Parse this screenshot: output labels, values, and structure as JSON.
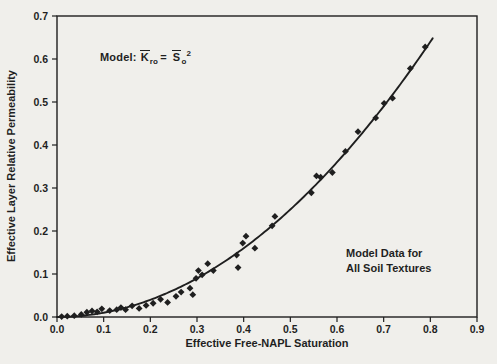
{
  "figure": {
    "background_color": "#f0efeb",
    "ink_color": "#1f1f1f"
  },
  "chart_data": {
    "type": "scatter",
    "title": "",
    "xlabel": "Effective Free-NAPL Saturation",
    "ylabel": "Effective Layer Relative Permeability",
    "xlim": [
      0.0,
      0.9
    ],
    "ylim": [
      0.0,
      0.7
    ],
    "grid": false,
    "legend": "none",
    "marker": "diamond",
    "xticks": [
      0.0,
      0.1,
      0.2,
      0.3,
      0.4,
      0.5,
      0.6,
      0.7,
      0.8,
      0.9
    ],
    "xtick_labels": [
      "0.0",
      "0.1",
      "0.2",
      "0.3",
      "0.4",
      "0.5",
      "0.6",
      "0.7",
      "0.8",
      "0.9"
    ],
    "yticks": [
      0.0,
      0.1,
      0.2,
      0.3,
      0.4,
      0.5,
      0.6,
      0.7
    ],
    "ytick_labels": [
      "0.0",
      "0.1",
      "0.2",
      "0.3",
      "0.4",
      "0.5",
      "0.6",
      "0.7"
    ],
    "points": [
      [
        0.01,
        0.001
      ],
      [
        0.022,
        0.002
      ],
      [
        0.037,
        0.003
      ],
      [
        0.052,
        0.006
      ],
      [
        0.064,
        0.011
      ],
      [
        0.075,
        0.014
      ],
      [
        0.086,
        0.012
      ],
      [
        0.096,
        0.019
      ],
      [
        0.113,
        0.015
      ],
      [
        0.128,
        0.017
      ],
      [
        0.137,
        0.022
      ],
      [
        0.147,
        0.017
      ],
      [
        0.161,
        0.026
      ],
      [
        0.176,
        0.02
      ],
      [
        0.191,
        0.027
      ],
      [
        0.206,
        0.032
      ],
      [
        0.222,
        0.041
      ],
      [
        0.237,
        0.034
      ],
      [
        0.255,
        0.048
      ],
      [
        0.266,
        0.058
      ],
      [
        0.285,
        0.067
      ],
      [
        0.291,
        0.052
      ],
      [
        0.298,
        0.09
      ],
      [
        0.303,
        0.108
      ],
      [
        0.311,
        0.098
      ],
      [
        0.323,
        0.124
      ],
      [
        0.335,
        0.108
      ],
      [
        0.385,
        0.144
      ],
      [
        0.388,
        0.115
      ],
      [
        0.398,
        0.172
      ],
      [
        0.405,
        0.188
      ],
      [
        0.424,
        0.16
      ],
      [
        0.461,
        0.212
      ],
      [
        0.467,
        0.234
      ],
      [
        0.545,
        0.289
      ],
      [
        0.556,
        0.328
      ],
      [
        0.565,
        0.325
      ],
      [
        0.59,
        0.336
      ],
      [
        0.618,
        0.385
      ],
      [
        0.645,
        0.431
      ],
      [
        0.683,
        0.463
      ],
      [
        0.701,
        0.497
      ],
      [
        0.719,
        0.509
      ],
      [
        0.757,
        0.578
      ],
      [
        0.789,
        0.628
      ]
    ],
    "model_curve": {
      "label": "Kro = So^2",
      "type": "power",
      "exponent": 2,
      "x_min": 0.0,
      "x_max": 0.805
    },
    "annotations": {
      "model_equation": {
        "prefix": "Model:",
        "k": "K",
        "k_sub": "ro",
        "equals": "=",
        "s": "S",
        "s_sub": "o",
        "exponent": "2"
      },
      "data_note_line1": "Model Data for",
      "data_note_line2": "All Soil Textures"
    }
  }
}
